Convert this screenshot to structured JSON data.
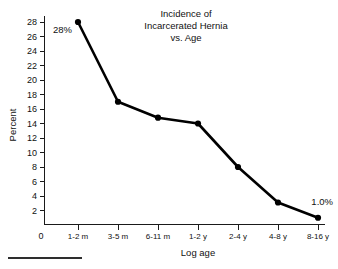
{
  "chart_data": {
    "type": "line",
    "title": "Incidence of Incarcerated Hernia vs. Age",
    "title_lines": [
      "Incidence of",
      "Incarcerated Hernia",
      "vs. Age"
    ],
    "xlabel": "Log age",
    "ylabel": "Percent",
    "categories": [
      "1-2 m",
      "3-5 m",
      "6-11 m",
      "1-2 y",
      "2-4 y",
      "4-8 y",
      "8-16 y"
    ],
    "values": [
      28.0,
      17.0,
      14.8,
      14.0,
      8.0,
      3.1,
      1.0
    ],
    "ylim": [
      0,
      28
    ],
    "yticks": [
      2,
      4,
      6,
      8,
      10,
      12,
      14,
      16,
      18,
      20,
      22,
      24,
      26,
      28
    ],
    "ytick_labels": [
      "2",
      "4",
      "6",
      "8",
      "10",
      "12",
      "14",
      "16",
      "18",
      "20",
      "22",
      "24",
      "26",
      "28"
    ],
    "origin_label": "0",
    "grid": false,
    "legend": false,
    "line_color": "#000000",
    "marker_color": "#000000",
    "axis_color": "#1a1a1a",
    "annotations": [
      {
        "text": "28%",
        "category": "1-2 m",
        "value": 28.0,
        "position": "below-left"
      },
      {
        "text": "1.0%",
        "category": "8-16 y",
        "value": 1.0,
        "position": "above-left"
      }
    ]
  }
}
